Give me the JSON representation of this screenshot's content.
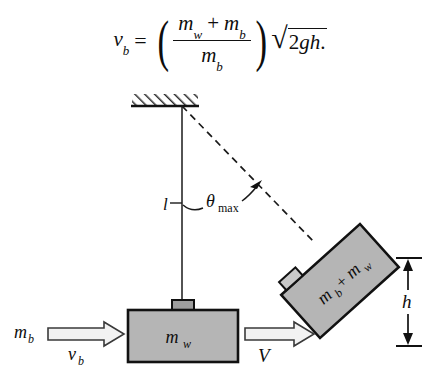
{
  "figure": {
    "type": "physics-diagram",
    "caption_equation": {
      "lhs_var": "v",
      "lhs_sub": "b",
      "equals": "=",
      "numerator_m1": "m",
      "numerator_m1_sub": "w",
      "numerator_plus": "+",
      "numerator_m2": "m",
      "numerator_m2_sub": "b",
      "denominator_m": "m",
      "denominator_sub": "b",
      "radical_sign": "√",
      "radicand_num": "2",
      "radicand_g": "g",
      "radicand_h": "h",
      "period": ".",
      "paren_open": "(",
      "paren_close": ")",
      "plain_text": "v_b = ((m_w + m_b)/m_b) sqrt(2gh)."
    },
    "elements": {
      "ceiling": {
        "name": "hatched-ceiling",
        "x": 132,
        "y": 94,
        "width": 66,
        "height": 12,
        "hatch_angle_deg": -45
      },
      "pivot": {
        "x": 182,
        "y": 106
      },
      "string_vertical": {
        "label": "l",
        "from": [
          182,
          106
        ],
        "to": [
          182,
          303
        ]
      },
      "string_dashed": {
        "from": [
          182,
          106
        ],
        "to": [
          313,
          240
        ],
        "dash": "7,5"
      },
      "angle_arc": {
        "label_theta": "θ",
        "label_sub": "max",
        "label_x": 208,
        "label_y": 207
      },
      "block_flat": {
        "label_m": "m",
        "label_sub": "w",
        "x": 128,
        "y": 310,
        "width": 110,
        "height": 52,
        "fill": "#b5b5b5",
        "stroke": "#111111",
        "tab": {
          "x": 172,
          "y": 300,
          "width": 22,
          "height": 10
        }
      },
      "block_tilted": {
        "label_m1": "m",
        "label_sub1": "b",
        "label_plus": "+",
        "label_m2": "m",
        "label_sub2": "w",
        "center": [
          340,
          281
        ],
        "width": 106,
        "height": 58,
        "rotation_deg": -42,
        "fill": "#b5b5b5",
        "stroke": "#111111"
      },
      "arrow_in": {
        "label_mass": "m",
        "label_mass_sub": "b",
        "label_vel": "v",
        "label_vel_sub": "b",
        "x1": 48,
        "x2": 122,
        "y": 334
      },
      "arrow_out": {
        "label_vel": "V",
        "x1": 245,
        "x2": 312,
        "y": 334
      },
      "height_dimension": {
        "label": "h",
        "x": 408,
        "y_top": 258,
        "y_bottom": 346,
        "tick_half_width": 11
      }
    },
    "colors": {
      "background": "#ffffff",
      "ink": "#0d0d0d",
      "block_fill": "#b5b5b5",
      "hatch": "#2a2a2a"
    }
  }
}
